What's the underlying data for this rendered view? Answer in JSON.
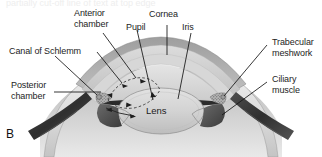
{
  "figure": {
    "panel_label": "B",
    "type": "anatomical cross-section diagram",
    "orientation": "Cornea uppermost, lens central, sclera lateral; bilaterally symmetric sagittal section",
    "style": "grayscale shaded medical illustration with leader-line callouts",
    "cropped_text_above": "partially cut-off line of text at top edge"
  },
  "labels": {
    "anterior_chamber": {
      "line1": "Anterior",
      "line2": "chamber"
    },
    "canal_of_schlemm": {
      "line1": "Canal of Schlemm"
    },
    "posterior_chamber": {
      "line1": "Posterior",
      "line2": "chamber"
    },
    "pupil": {
      "line1": "Pupil"
    },
    "cornea": {
      "line1": "Cornea"
    },
    "iris": {
      "line1": "Iris"
    },
    "trabecular_meshwork": {
      "line1": "Trabecular",
      "line2": "meshwork"
    },
    "ciliary_muscle": {
      "line1": "Ciliary",
      "line2": "muscle"
    },
    "lens": {
      "line1": "Lens"
    }
  },
  "structures": [
    {
      "name": "cornea",
      "description": "transparent dome, three shaded layers",
      "tone": "#b8b8b8"
    },
    {
      "name": "anterior-chamber",
      "description": "space between cornea and iris/lens",
      "tone": "#d8d8d8"
    },
    {
      "name": "posterior-chamber",
      "description": "narrow space behind iris, front of lens",
      "tone": "#cfcfcf"
    },
    {
      "name": "lens",
      "description": "central biconvex ellipse",
      "tone": "#d2d2d2"
    },
    {
      "name": "iris",
      "description": "dark wedge bordering pupil aperture",
      "tone": "#2e2e2e"
    },
    {
      "name": "pupil",
      "description": "central aperture between iris margins",
      "tone": "#c9c9c9"
    },
    {
      "name": "sclera",
      "description": "outer white coat, light band",
      "tone": "#e6e6e6"
    },
    {
      "name": "ciliary-muscle",
      "description": "dark triangular mass lateral to lens",
      "tone": "#4a4a4a"
    },
    {
      "name": "trabecular-meshwork",
      "description": "stippled tissue at iridocorneal angle",
      "tone": "#8a8a8a"
    },
    {
      "name": "canal-of-schlemm",
      "description": "small circular channel in angle",
      "tone": "#9a9a9a"
    },
    {
      "name": "extraocular-tendon",
      "description": "dark oblique straps at lower left and lower right",
      "tone": "#3a3a3a"
    },
    {
      "name": "vitreous-body",
      "description": "large pale mass filling lower portion",
      "tone": "#c6c6c6"
    },
    {
      "name": "aqueous-flow-arrows",
      "description": "dashed arc with small arrowheads tracing aqueous humor circulation",
      "tone": "#222222"
    }
  ],
  "colors": {
    "background": "#ffffff",
    "text": "#1d1d1d",
    "leader_line": "#141414",
    "dark_tissue": "#2e2e2e",
    "mid_tissue": "#8f8f8f",
    "light_tissue": "#dcdcdc"
  }
}
